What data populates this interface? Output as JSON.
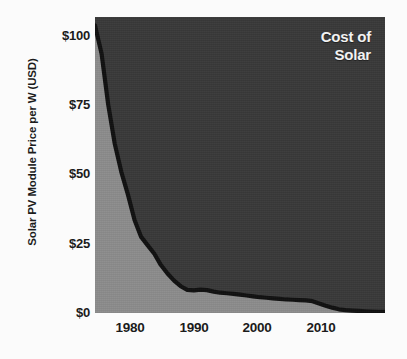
{
  "chart_data": {
    "type": "area",
    "title": "Cost of Solar",
    "title_lines": [
      "Cost of",
      "Solar"
    ],
    "xlabel": "",
    "ylabel": "Solar PV Module Price per W (USD)",
    "xlim": [
      1975,
      2019
    ],
    "ylim": [
      0,
      105
    ],
    "grid": false,
    "legend": null,
    "y_ticks": [
      0,
      25,
      50,
      75,
      100
    ],
    "y_tick_labels": [
      "$0",
      "$25",
      "$50",
      "$75",
      "$100"
    ],
    "x_ticks": [
      1980,
      1990,
      2000,
      2010
    ],
    "x_tick_labels": [
      "1980",
      "1990",
      "2000",
      "2010"
    ],
    "colors": {
      "page_background": "#fbfbfb",
      "area_above_curve": "#3a3a3a",
      "area_below_curve": "#8d8d8d",
      "curve_line": "#111111",
      "title_text": "#f2f2f2",
      "axis_text": "#1b1b1b"
    },
    "series": [
      {
        "name": "Solar PV Module Price per W (USD)",
        "x": [
          1975,
          1976,
          1977,
          1978,
          1979,
          1980,
          1981,
          1982,
          1983,
          1984,
          1985,
          1986,
          1987,
          1988,
          1989,
          1990,
          1991,
          1992,
          1993,
          1994,
          1995,
          1996,
          1997,
          1998,
          1999,
          2000,
          2001,
          2002,
          2003,
          2004,
          2005,
          2006,
          2007,
          2008,
          2009,
          2010,
          2011,
          2012,
          2013,
          2014,
          2015,
          2016,
          2017,
          2018,
          2019
        ],
        "values": [
          102,
          92,
          74,
          60,
          50,
          42,
          33,
          27,
          24,
          21,
          17,
          14,
          11.5,
          9.5,
          8.2,
          8.0,
          8.3,
          8.1,
          7.6,
          7.2,
          7.0,
          6.8,
          6.5,
          6.2,
          5.9,
          5.6,
          5.4,
          5.2,
          5.0,
          4.8,
          4.7,
          4.6,
          4.5,
          4.2,
          3.4,
          2.6,
          1.9,
          1.3,
          1.0,
          0.85,
          0.72,
          0.62,
          0.52,
          0.45,
          0.38
        ]
      }
    ]
  }
}
